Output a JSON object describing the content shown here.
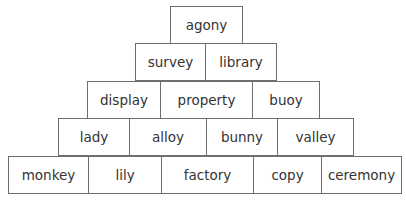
{
  "pyramid": {
    "rows": [
      {
        "y": 6,
        "h": 38,
        "cells": [
          {
            "word": "agony",
            "x": 170,
            "w": 73
          }
        ]
      },
      {
        "y": 43,
        "h": 38,
        "cells": [
          {
            "word": "survey",
            "x": 135,
            "w": 71
          },
          {
            "word": "library",
            "x": 205,
            "w": 72
          }
        ]
      },
      {
        "y": 81,
        "h": 38,
        "cells": [
          {
            "word": "display",
            "x": 87,
            "w": 74
          },
          {
            "word": "property",
            "x": 160,
            "w": 93
          },
          {
            "word": "buoy",
            "x": 252,
            "w": 68
          }
        ]
      },
      {
        "y": 118,
        "h": 38,
        "cells": [
          {
            "word": "lady",
            "x": 58,
            "w": 72
          },
          {
            "word": "alloy",
            "x": 129,
            "w": 78
          },
          {
            "word": "bunny",
            "x": 206,
            "w": 72
          },
          {
            "word": "valley",
            "x": 277,
            "w": 77
          }
        ]
      },
      {
        "y": 156,
        "h": 38,
        "cells": [
          {
            "word": "monkey",
            "x": 8,
            "w": 81
          },
          {
            "word": "lily",
            "x": 88,
            "w": 74
          },
          {
            "word": "factory",
            "x": 161,
            "w": 93
          },
          {
            "word": "copy",
            "x": 253,
            "w": 69
          },
          {
            "word": "ceremony",
            "x": 321,
            "w": 81
          }
        ]
      }
    ]
  }
}
